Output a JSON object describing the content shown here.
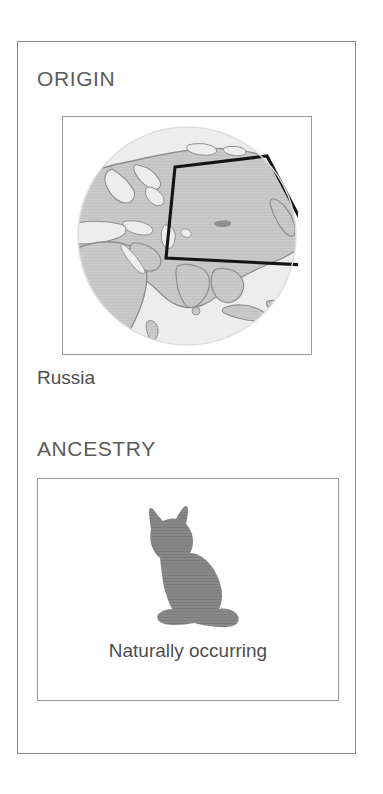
{
  "card": {
    "sections": [
      {
        "id": "origin",
        "heading": "ORIGIN",
        "caption": "Russia",
        "figure": "world-globe-map"
      },
      {
        "id": "ancestry",
        "heading": "ANCESTRY",
        "caption": "Naturally occurring",
        "figure": "sitting-cat-silhouette"
      }
    ]
  },
  "origin": {
    "heading": "ORIGIN",
    "caption": "Russia",
    "map": {
      "icon": "globe-icon",
      "highlight_region": "Russia",
      "hemisphere": "Eastern Hemisphere",
      "land_color": "#c9c9c9",
      "ocean_color": "#ededed",
      "coastline_color": "#8e8e8e",
      "highlight_outline_color": "#1a1a1a"
    }
  },
  "ancestry": {
    "heading": "ANCESTRY",
    "caption": "Naturally occurring",
    "silhouette": {
      "icon": "cat-silhouette-icon",
      "color": "#868686"
    }
  },
  "colors": {
    "card_border": "#8b8b8b",
    "frame_border": "#9a9a9a",
    "heading_text": "#5b5b5b",
    "caption_text": "#4e4e4e",
    "background": "#ffffff"
  }
}
